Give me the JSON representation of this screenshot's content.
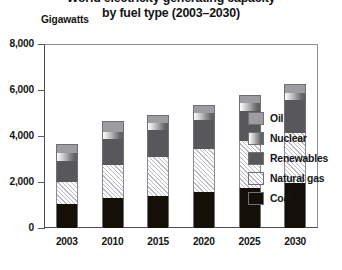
{
  "chart_data": {
    "type": "bar",
    "subtype": "stacked-bar",
    "title": "World electricity generating capacity by fuel type (2003–2030)",
    "title_lines": [
      "World electricity generating capacity",
      "by fuel type (2003–2030)"
    ],
    "ylabel": "Gigawatts",
    "xlabel": "",
    "ylim": [
      0,
      8000
    ],
    "yticks": [
      0,
      2000,
      4000,
      6000,
      8000
    ],
    "ytick_labels": [
      "0",
      "2,000",
      "4,000",
      "6,000",
      "8,000"
    ],
    "grid": false,
    "legend_position": "right",
    "categories": [
      "2003",
      "2010",
      "2015",
      "2020",
      "2025",
      "2030"
    ],
    "stack_order_bottom_to_top": [
      "Coal",
      "Natural gas",
      "Renewables",
      "Nuclear",
      "Oil"
    ],
    "series": [
      {
        "name": "Coal",
        "color": "#141008",
        "values": [
          1050,
          1300,
          1400,
          1550,
          1750,
          1950
        ]
      },
      {
        "name": "Natural gas",
        "color": "#ffffff",
        "pattern": "diagonal-hatch",
        "values": [
          950,
          1450,
          1700,
          1900,
          2050,
          2200
        ]
      },
      {
        "name": "Renewables",
        "color": "#58585a",
        "values": [
          900,
          1100,
          1150,
          1250,
          1300,
          1400
        ]
      },
      {
        "name": "Nuclear",
        "color": "#9e9ea0",
        "pattern": "gradient",
        "values": [
          370,
          330,
          330,
          320,
          330,
          330
        ]
      },
      {
        "name": "Oil",
        "color": "#9d9d9f",
        "values": [
          380,
          470,
          320,
          330,
          370,
          370
        ]
      }
    ],
    "totals": [
      3650,
      4650,
      4900,
      5350,
      5800,
      6250
    ],
    "annotations": []
  },
  "legend": {
    "items": [
      {
        "label": "Oil",
        "swatch": "oil-swatch"
      },
      {
        "label": "Nuclear",
        "swatch": "nuclear-swatch"
      },
      {
        "label": "Renewables",
        "swatch": "renewables-swatch"
      },
      {
        "label": "Natural gas",
        "swatch": "natural-gas-swatch"
      },
      {
        "label": "Coal",
        "swatch": "coal-swatch"
      }
    ]
  }
}
